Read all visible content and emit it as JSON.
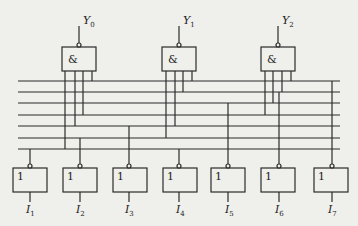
{
  "diagram": {
    "type": "logic-circuit",
    "and_gates": [
      {
        "id": "Y0",
        "symbol": "&",
        "output_label": "Y",
        "output_sub": "0"
      },
      {
        "id": "Y1",
        "symbol": "&",
        "output_label": "Y",
        "output_sub": "1"
      },
      {
        "id": "Y2",
        "symbol": "&",
        "output_label": "Y",
        "output_sub": "2"
      }
    ],
    "not_gates": [
      {
        "id": "I1",
        "symbol": "1",
        "input_label": "I",
        "input_sub": "1"
      },
      {
        "id": "I2",
        "symbol": "1",
        "input_label": "I",
        "input_sub": "2"
      },
      {
        "id": "I3",
        "symbol": "1",
        "input_label": "I",
        "input_sub": "3"
      },
      {
        "id": "I4",
        "symbol": "1",
        "input_label": "I",
        "input_sub": "4"
      },
      {
        "id": "I5",
        "symbol": "1",
        "input_label": "I",
        "input_sub": "5"
      },
      {
        "id": "I6",
        "symbol": "1",
        "input_label": "I",
        "input_sub": "6"
      },
      {
        "id": "I7",
        "symbol": "1",
        "input_label": "I",
        "input_sub": "7"
      }
    ],
    "bus_lines": 7,
    "colors": {
      "background": "#efefeb",
      "stroke": "#2a2a2a"
    }
  }
}
